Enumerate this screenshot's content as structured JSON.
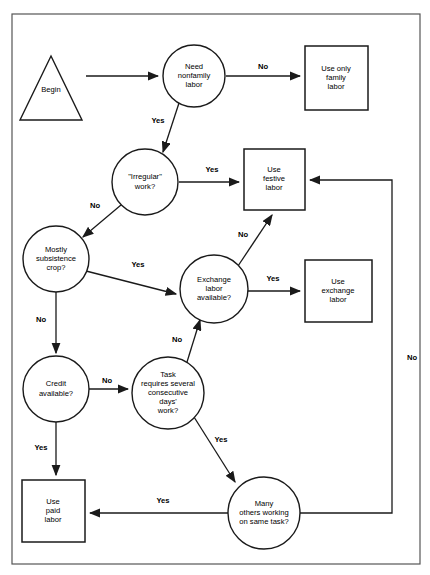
{
  "diagram": {
    "frame": {
      "x": 12,
      "y": 14,
      "width": 408,
      "height": 550,
      "stroke": "#555555"
    },
    "colors": {
      "stroke": "#1a1a1a",
      "fill": "#ffffff",
      "text": "#000000",
      "frame": "#555555"
    },
    "nodes": [
      {
        "id": "begin",
        "type": "triangle",
        "label_lines": [
          "Begin"
        ],
        "cx": 51,
        "cy": 88,
        "width": 62,
        "height": 64,
        "label_x": 51,
        "label_y": 90
      },
      {
        "id": "need-nonfamily-labor",
        "type": "circle",
        "label_lines": [
          "Need",
          "nonfamily",
          "labor"
        ],
        "cx": 194,
        "cy": 76,
        "r": 31,
        "label_x": 194,
        "label_y": 76
      },
      {
        "id": "use-only-family-labor",
        "type": "box",
        "label_lines": [
          "Use only",
          "family",
          "labor"
        ],
        "x": 305,
        "y": 46,
        "width": 63,
        "height": 64,
        "label_x": 336,
        "label_y": 78
      },
      {
        "id": "irregular-work",
        "type": "circle",
        "label_lines": [
          "\"Irregular\"",
          "work?"
        ],
        "cx": 145,
        "cy": 182,
        "r": 33,
        "label_x": 145,
        "label_y": 182
      },
      {
        "id": "use-festive-labor",
        "type": "box",
        "label_lines": [
          "Use",
          "festive",
          "labor"
        ],
        "x": 244,
        "y": 149,
        "width": 61,
        "height": 61,
        "label_x": 274,
        "label_y": 179
      },
      {
        "id": "mostly-subsistence-crop",
        "type": "circle",
        "label_lines": [
          "Mostly",
          "subsistence",
          "crop?"
        ],
        "cx": 56,
        "cy": 259,
        "r": 33,
        "label_x": 56,
        "label_y": 259
      },
      {
        "id": "exchange-labor-available",
        "type": "circle",
        "label_lines": [
          "Exchange",
          "labor",
          "available?"
        ],
        "cx": 214,
        "cy": 289,
        "r": 34,
        "label_x": 214,
        "label_y": 289
      },
      {
        "id": "use-exchange-labor",
        "type": "box",
        "label_lines": [
          "Use",
          "exchange",
          "labor"
        ],
        "x": 305,
        "y": 260,
        "width": 67,
        "height": 62,
        "label_x": 338,
        "label_y": 291
      },
      {
        "id": "credit-available",
        "type": "circle",
        "label_lines": [
          "Credit",
          "available?"
        ],
        "cx": 56,
        "cy": 389,
        "r": 33,
        "label_x": 56,
        "label_y": 389
      },
      {
        "id": "task-requires-days",
        "type": "circle",
        "label_lines": [
          "Task",
          "requires several",
          "consecutive",
          "days'",
          "work?"
        ],
        "cx": 168,
        "cy": 393,
        "r": 36,
        "label_x": 168,
        "label_y": 393
      },
      {
        "id": "many-others-working",
        "type": "circle",
        "label_lines": [
          "Many",
          "others working",
          "on same task?"
        ],
        "cx": 264,
        "cy": 513,
        "r": 36,
        "label_x": 264,
        "label_y": 513
      },
      {
        "id": "use-paid-labor",
        "type": "box",
        "label_lines": [
          "Use",
          "paid",
          "labor"
        ],
        "x": 22,
        "y": 480,
        "width": 63,
        "height": 62,
        "label_x": 53,
        "label_y": 511
      }
    ],
    "edges": [
      {
        "id": "begin-to-need",
        "from": "begin",
        "to": "need-nonfamily-labor",
        "label": "",
        "path": "M 86 76 L 158 76"
      },
      {
        "id": "need-no-family",
        "from": "need-nonfamily-labor",
        "to": "use-only-family-labor",
        "label": "No",
        "label_x": 263,
        "label_y": 67,
        "path": "M 226 76 L 300 76"
      },
      {
        "id": "need-yes-irregular",
        "from": "need-nonfamily-labor",
        "to": "irregular-work",
        "label": "Yes",
        "label_x": 158,
        "label_y": 121,
        "path": "M 179 103 L 163 152"
      },
      {
        "id": "irregular-yes-festive",
        "from": "irregular-work",
        "to": "use-festive-labor",
        "label": "Yes",
        "label_x": 212,
        "label_y": 170,
        "path": "M 179 182 L 239 182"
      },
      {
        "id": "irregular-no-subsistence",
        "from": "irregular-work",
        "to": "mostly-subsistence-crop",
        "label": "No",
        "label_x": 95,
        "label_y": 206,
        "path": "M 121 205 L 83 237"
      },
      {
        "id": "subsistence-yes-exchange",
        "from": "mostly-subsistence-crop",
        "to": "exchange-labor-available",
        "label": "Yes",
        "label_x": 138,
        "label_y": 265,
        "path": "M 86 271 L 176 294"
      },
      {
        "id": "subsistence-no-credit",
        "from": "mostly-subsistence-crop",
        "to": "credit-available",
        "label": "No",
        "label_x": 41,
        "label_y": 320,
        "path": "M 56 292 L 56 353"
      },
      {
        "id": "exchange-yes-use-exchange",
        "from": "exchange-labor-available",
        "to": "use-exchange-labor",
        "label": "Yes",
        "label_x": 273,
        "label_y": 279,
        "path": "M 248 291 L 300 291"
      },
      {
        "id": "exchange-no-festive",
        "from": "exchange-labor-available",
        "to": "use-festive-labor",
        "label": "No",
        "label_x": 243,
        "label_y": 235,
        "path": "M 238 266 L 272 215"
      },
      {
        "id": "credit-no-task",
        "from": "credit-available",
        "to": "task-requires-days",
        "label": "No",
        "label_x": 107,
        "label_y": 381,
        "path": "M 89 389 L 128 389"
      },
      {
        "id": "credit-yes-paid",
        "from": "credit-available",
        "to": "use-paid-labor",
        "label": "Yes",
        "label_x": 41,
        "label_y": 448,
        "path": "M 56 422 L 56 475"
      },
      {
        "id": "task-no-exchange",
        "from": "task-requires-days",
        "to": "exchange-labor-available",
        "label": "No",
        "label_x": 177,
        "label_y": 340,
        "path": "M 187 362 L 200 320"
      },
      {
        "id": "task-yes-many-others",
        "from": "task-requires-days",
        "to": "many-others-working",
        "label": "Yes",
        "label_x": 221,
        "label_y": 440,
        "path": "M 194 417 L 235 482"
      },
      {
        "id": "many-others-yes-paid",
        "from": "many-others-working",
        "to": "use-paid-labor",
        "label": "Yes",
        "label_x": 163,
        "label_y": 501,
        "path": "M 228 513 L 90 513"
      },
      {
        "id": "many-others-no-festive",
        "from": "many-others-working",
        "to": "use-festive-labor",
        "label": "No",
        "label_x": 412,
        "label_y": 358,
        "path": "M 300 513 L 392 513 L 392 180 L 310 180"
      }
    ]
  }
}
